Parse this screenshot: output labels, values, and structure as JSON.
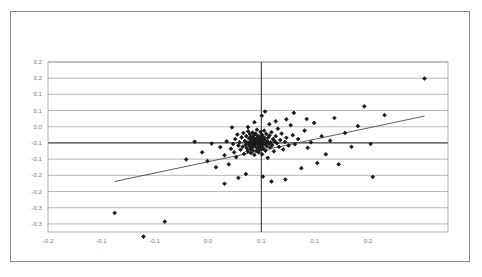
{
  "chart_data": {
    "type": "scatter",
    "title": "",
    "subtitle": "",
    "xlabel": "",
    "ylabel": "",
    "xlim": [
      -0.2,
      0.175
    ],
    "ylim": [
      -0.275,
      0.25
    ],
    "grid": true,
    "legend": null,
    "legend_position": "none",
    "marker_color": "#1a1a1a",
    "gridline_color": "#9a9a9a",
    "axis_color": "#3a3a3a",
    "trendline_color": "#4a4a4a",
    "frame_color": "#8a8a8a",
    "tick_label_color": "#7d7d7d",
    "x_ticks": [
      -0.2,
      -0.15,
      -0.1,
      -0.05,
      0.0,
      0.05,
      0.1,
      0.15
    ],
    "x_tick_labels": [
      "-0.2",
      "-0.1",
      "-0.1",
      "0.0",
      "0.1",
      "0.1",
      "0.2"
    ],
    "x_tick_values": [
      -0.2,
      -0.15,
      -0.1,
      -0.05,
      0.0,
      0.05,
      0.1,
      0.15
    ],
    "y_ticks": [
      0.25,
      0.2,
      0.15,
      0.1,
      0.05,
      0.0,
      -0.05,
      -0.1,
      -0.15,
      -0.2,
      -0.25
    ],
    "y_tick_labels": [
      "0.2",
      "0.2",
      "0.1",
      "0.1",
      "0.0",
      "-0.1",
      "-0.1",
      "-0.2",
      "-0.2",
      "-0.3",
      "-0.3"
    ],
    "zero_line_x": 0.0,
    "zero_line_y": 0.0,
    "trendline": {
      "x_start": -0.1375,
      "y_start": -0.119,
      "x_end": 0.153,
      "y_end": 0.083,
      "slope": 0.695,
      "intercept": -0.0235
    },
    "points": [
      [
        -0.1375,
        -0.216
      ],
      [
        -0.1105,
        -0.289
      ],
      [
        -0.0905,
        -0.243
      ],
      [
        -0.0555,
        -0.029
      ],
      [
        -0.0505,
        -0.056
      ],
      [
        -0.0465,
        -0.002
      ],
      [
        -0.0425,
        -0.075
      ],
      [
        -0.0385,
        -0.013
      ],
      [
        -0.0345,
        -0.038
      ],
      [
        -0.0325,
        0.005
      ],
      [
        -0.0305,
        -0.066
      ],
      [
        -0.0285,
        -0.018
      ],
      [
        -0.0275,
        0.048
      ],
      [
        -0.0265,
        -0.003
      ],
      [
        -0.0255,
        -0.029
      ],
      [
        -0.0245,
        0.012
      ],
      [
        -0.0235,
        -0.044
      ],
      [
        -0.0225,
        0.026
      ],
      [
        -0.0215,
        -0.008
      ],
      [
        -0.0205,
        0.002
      ],
      [
        -0.0195,
        -0.021
      ],
      [
        -0.0185,
        0.017
      ],
      [
        -0.0175,
        -0.012
      ],
      [
        -0.0168,
        0.031
      ],
      [
        -0.0162,
        -0.034
      ],
      [
        -0.0155,
        0.006
      ],
      [
        -0.0148,
        -0.006
      ],
      [
        -0.0142,
        0.021
      ],
      [
        -0.0136,
        -0.016
      ],
      [
        -0.0132,
        0.001
      ],
      [
        -0.0128,
        -0.026
      ],
      [
        -0.0124,
        0.036
      ],
      [
        -0.012,
        -0.001
      ],
      [
        -0.0116,
        0.014
      ],
      [
        -0.0112,
        -0.009
      ],
      [
        -0.0108,
        0.027
      ],
      [
        -0.0104,
        -0.019
      ],
      [
        -0.0101,
        0.004
      ],
      [
        -0.0098,
        -0.031
      ],
      [
        -0.0095,
        0.019
      ],
      [
        -0.0092,
        -0.004
      ],
      [
        -0.0089,
        0.009
      ],
      [
        -0.0086,
        -0.014
      ],
      [
        -0.0083,
        0.032
      ],
      [
        -0.008,
        -0.023
      ],
      [
        -0.0077,
        0.0
      ],
      [
        -0.0074,
        0.016
      ],
      [
        -0.0071,
        -0.007
      ],
      [
        -0.0068,
        0.024
      ],
      [
        -0.0065,
        -0.037
      ],
      [
        -0.0062,
        0.008
      ],
      [
        -0.0059,
        -0.011
      ],
      [
        -0.0056,
        0.029
      ],
      [
        -0.0053,
        -0.002
      ],
      [
        -0.005,
        0.013
      ],
      [
        -0.0047,
        -0.025
      ],
      [
        -0.0044,
        0.003
      ],
      [
        -0.0041,
        0.041
      ],
      [
        -0.0038,
        -0.016
      ],
      [
        -0.0035,
        0.022
      ],
      [
        -0.0032,
        -0.005
      ],
      [
        -0.0029,
        0.011
      ],
      [
        -0.0026,
        -0.029
      ],
      [
        -0.0023,
        0.0
      ],
      [
        -0.002,
        0.018
      ],
      [
        -0.0017,
        -0.009
      ],
      [
        -0.0014,
        0.006
      ],
      [
        -0.0011,
        -0.02
      ],
      [
        -0.0008,
        0.034
      ],
      [
        -0.0005,
        -0.001
      ],
      [
        -0.0002,
        0.015
      ],
      [
        0.0001,
        -0.012
      ],
      [
        0.0004,
        0.026
      ],
      [
        0.0007,
        -0.035
      ],
      [
        0.001,
        0.004
      ],
      [
        0.0013,
        -0.006
      ],
      [
        0.0016,
        0.02
      ],
      [
        0.0019,
        -0.017
      ],
      [
        0.0022,
        0.009
      ],
      [
        0.0026,
        0.038
      ],
      [
        0.003,
        -0.002
      ],
      [
        0.0034,
        0.014
      ],
      [
        0.0038,
        -0.024
      ],
      [
        0.0042,
        0.001
      ],
      [
        0.0046,
        0.028
      ],
      [
        0.005,
        -0.01
      ],
      [
        0.0055,
        0.006
      ],
      [
        0.006,
        -0.046
      ],
      [
        0.0065,
        0.017
      ],
      [
        0.007,
        -0.003
      ],
      [
        0.0076,
        0.023
      ],
      [
        0.0082,
        -0.014
      ],
      [
        0.0088,
        0.002
      ],
      [
        0.0095,
        0.033
      ],
      [
        0.0102,
        -0.007
      ],
      [
        0.011,
        0.012
      ],
      [
        0.0118,
        -0.026
      ],
      [
        0.0126,
        0.005
      ],
      [
        0.0135,
        0.021
      ],
      [
        0.0145,
        -0.001
      ],
      [
        0.0155,
        0.044
      ],
      [
        0.0166,
        -0.012
      ],
      [
        0.0178,
        0.009
      ],
      [
        0.019,
        0.029
      ],
      [
        0.0205,
        -0.02
      ],
      [
        0.022,
        0.003
      ],
      [
        0.0235,
        0.016
      ],
      [
        0.0255,
        -0.008
      ],
      [
        0.0275,
        0.055
      ],
      [
        0.0295,
        0.024
      ],
      [
        0.0315,
        -0.004
      ],
      [
        0.0345,
        0.012
      ],
      [
        0.0375,
        -0.078
      ],
      [
        0.0405,
        0.038
      ],
      [
        0.0435,
        -0.015
      ],
      [
        0.0465,
        0.002
      ],
      [
        0.0495,
        0.062
      ],
      [
        0.0525,
        -0.062
      ],
      [
        0.0565,
        0.021
      ],
      [
        0.0605,
        -0.035
      ],
      [
        0.0645,
        0.007
      ],
      [
        0.0685,
        0.077
      ],
      [
        0.0725,
        -0.066
      ],
      [
        0.0785,
        0.031
      ],
      [
        0.0845,
        -0.012
      ],
      [
        0.0905,
        0.052
      ],
      [
        0.0965,
        0.113
      ],
      [
        0.1025,
        -0.003
      ],
      [
        0.1045,
        -0.105
      ],
      [
        0.1155,
        0.086
      ],
      [
        0.153,
        0.199
      ],
      [
        -0.0625,
        0.004
      ],
      [
        -0.0705,
        -0.051
      ],
      [
        -0.0345,
        -0.126
      ],
      [
        -0.0215,
        -0.108
      ],
      [
        -0.0145,
        -0.096
      ],
      [
        0.0015,
        -0.104
      ],
      [
        0.0095,
        -0.119
      ],
      [
        0.0225,
        -0.113
      ],
      [
        0.0005,
        0.084
      ],
      [
        0.0035,
        0.097
      ],
      [
        0.0075,
        0.058
      ],
      [
        0.0135,
        0.067
      ],
      [
        0.0235,
        0.073
      ],
      [
        -0.0065,
        0.064
      ],
      [
        -0.0125,
        0.049
      ],
      [
        0.0305,
        0.093
      ],
      [
        0.0425,
        0.074
      ]
    ]
  }
}
